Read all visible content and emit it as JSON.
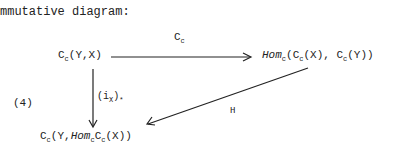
{
  "intro": "mmutative diagram:",
  "equation_label": "(4)",
  "nodes": {
    "top_left": {
      "base": "C",
      "sub": "c",
      "args": "(Y,X)"
    },
    "top_right": {
      "hom": "Hom",
      "hom_sub": "c",
      "open": "(",
      "c1": "C",
      "c1_sub": "c",
      "a1": "(X), ",
      "c2": "C",
      "c2_sub": "c",
      "a2": "(Y))"
    },
    "bottom": {
      "c": "C",
      "c_sub": "c",
      "a": "(Y,",
      "hom": "Hom",
      "hom_sub": "c",
      "c2": "C",
      "c2_sub": "c",
      "a2": "(X))"
    }
  },
  "arrows": {
    "top": {
      "label": "C",
      "label_sub": "c"
    },
    "left": {
      "label_open": "(i",
      "label_sub": "X",
      "label_close": ")",
      "star": "*"
    },
    "diagonal": {
      "label": "H"
    }
  }
}
